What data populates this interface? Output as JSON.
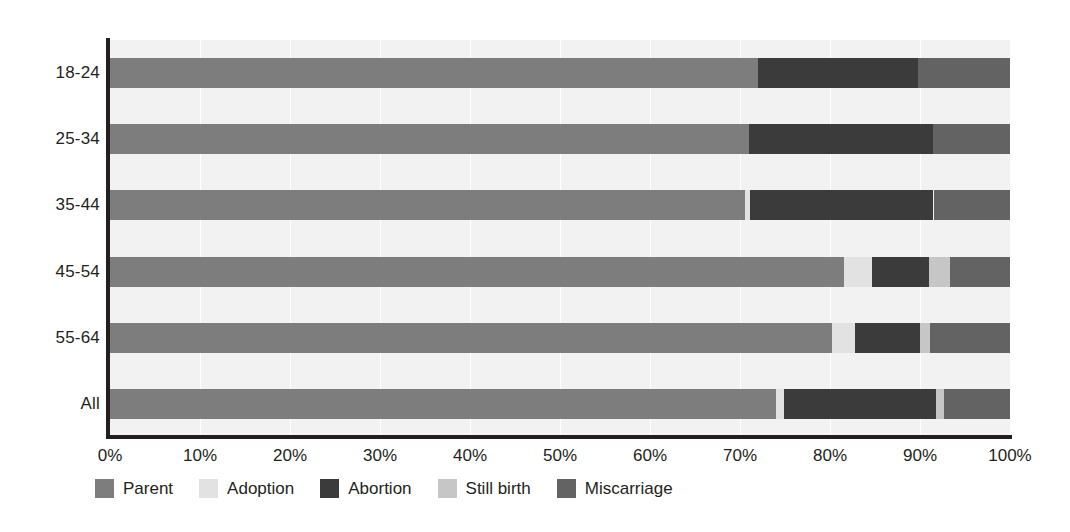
{
  "chart_data": {
    "type": "bar",
    "subtype": "stacked-horizontal-100percent",
    "title": "",
    "xlabel": "",
    "ylabel": "",
    "xlim": [
      0,
      100
    ],
    "xticks": [
      "0%",
      "10%",
      "20%",
      "30%",
      "40%",
      "50%",
      "60%",
      "70%",
      "80%",
      "90%",
      "100%"
    ],
    "xtick_values": [
      0,
      10,
      20,
      30,
      40,
      50,
      60,
      70,
      80,
      90,
      100
    ],
    "grid": true,
    "grid_axis": "x",
    "legend_position": "bottom",
    "categories": [
      "18-24",
      "25-34",
      "35-44",
      "45-54",
      "55-64",
      "All"
    ],
    "series": [
      {
        "name": "Parent",
        "color": "#7d7d7d",
        "values": [
          72.0,
          71.0,
          70.5,
          81.5,
          80.2,
          74.0
        ]
      },
      {
        "name": "Adoption",
        "color": "#e2e2e2",
        "values": [
          0.0,
          0.0,
          0.6,
          3.2,
          2.6,
          0.9
        ]
      },
      {
        "name": "Abortion",
        "color": "#3b3b3b",
        "values": [
          17.8,
          20.4,
          20.4,
          6.3,
          7.2,
          16.9
        ]
      },
      {
        "name": "Still birth",
        "color": "#c6c6c6",
        "values": [
          0.0,
          0.0,
          0.0,
          2.3,
          1.1,
          0.9
        ]
      },
      {
        "name": "Miscarriage",
        "color": "#636363",
        "values": [
          10.2,
          8.6,
          8.5,
          6.7,
          8.9,
          7.3
        ]
      }
    ],
    "plot_background": "#f2f2f2",
    "axis_color": "#231f20"
  },
  "legend": {
    "items": [
      {
        "label": "Parent",
        "color": "#7d7d7d",
        "swatch_name": "legend-swatch-parent"
      },
      {
        "label": "Adoption",
        "color": "#e2e2e2",
        "swatch_name": "legend-swatch-adoption"
      },
      {
        "label": "Abortion",
        "color": "#3b3b3b",
        "swatch_name": "legend-swatch-abortion"
      },
      {
        "label": "Still birth",
        "color": "#c6c6c6",
        "swatch_name": "legend-swatch-still-birth"
      },
      {
        "label": "Miscarriage",
        "color": "#636363",
        "swatch_name": "legend-swatch-miscarriage"
      }
    ]
  }
}
